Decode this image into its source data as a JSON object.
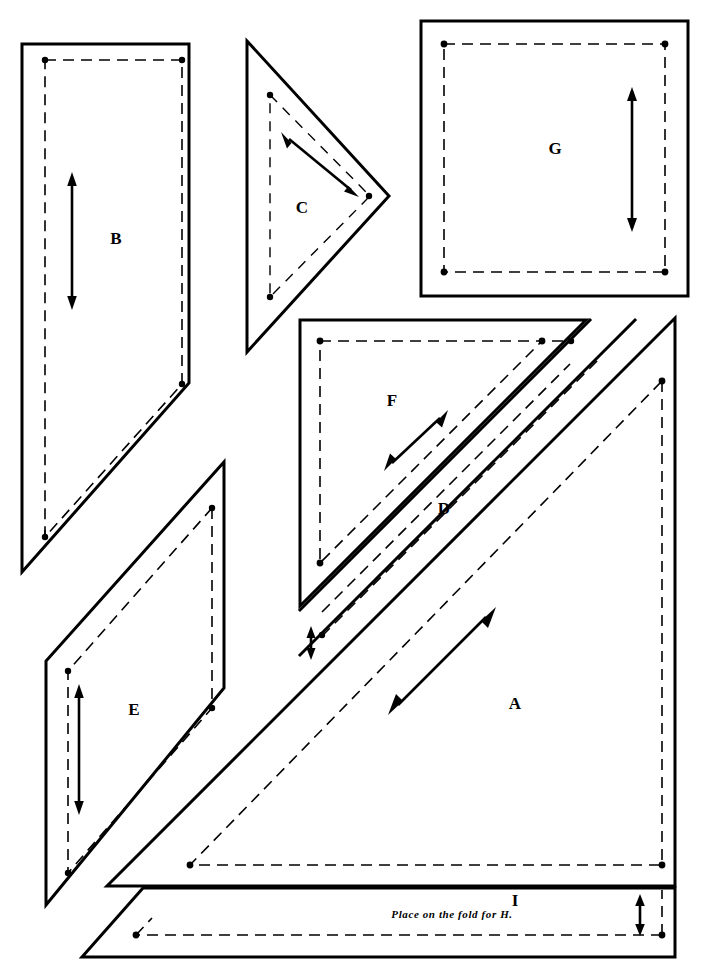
{
  "sheet": {
    "title": "Quilt block pattern template sheet",
    "background_color": "#ffffff",
    "line_color": "#000000",
    "width": 709,
    "height": 971
  },
  "notes": {
    "fold_note": "Place on the fold for H."
  },
  "pieces": [
    {
      "id": "A",
      "label": "A",
      "shape": "right-triangle",
      "label_x": 515,
      "label_y": 705,
      "grain_arrow": "diagonal-up-right"
    },
    {
      "id": "B",
      "label": "B",
      "shape": "pentagon",
      "label_x": 116,
      "label_y": 240,
      "grain_arrow": "vertical"
    },
    {
      "id": "C",
      "label": "C",
      "shape": "triangle",
      "label_x": 302,
      "label_y": 209,
      "grain_arrow": "diagonal-up-left"
    },
    {
      "id": "D",
      "label": "D",
      "shape": "diagonal-strip",
      "label_x": 444,
      "label_y": 510,
      "grain_arrow": "none"
    },
    {
      "id": "E",
      "label": "E",
      "shape": "parallelogram",
      "label_x": 134,
      "label_y": 711,
      "grain_arrow": "vertical"
    },
    {
      "id": "F",
      "label": "F",
      "shape": "right-triangle",
      "label_x": 392,
      "label_y": 402,
      "grain_arrow": "diagonal-up-right"
    },
    {
      "id": "G",
      "label": "G",
      "shape": "square",
      "label_x": 555,
      "label_y": 150,
      "grain_arrow": "vertical"
    },
    {
      "id": "I",
      "label": "I",
      "shape": "rectangle-strip",
      "label_x": 515,
      "label_y": 902,
      "grain_arrow": "vertical-short"
    }
  ],
  "legend": {
    "cut_line_style": "solid",
    "seam_line_style": "dashed",
    "grain_line_style": "double-headed-arrow"
  }
}
